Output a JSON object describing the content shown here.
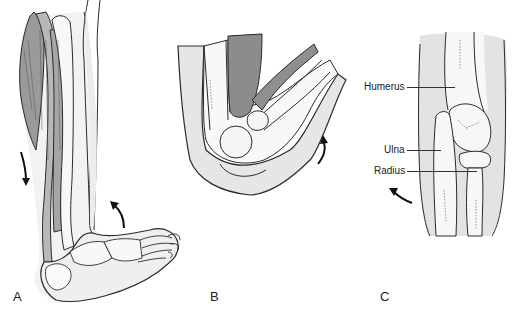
{
  "figure": {
    "panels": [
      {
        "id": "A",
        "label": "A",
        "subject": "lower leg and foot, lateral view with calf muscles",
        "arrows": [
          {
            "direction": "down",
            "meaning": "muscle pull"
          },
          {
            "direction": "up-curved",
            "meaning": "foot dorsiflexion"
          }
        ]
      },
      {
        "id": "B",
        "label": "B",
        "subject": "flexed elbow joint, lateral view",
        "arrows": [
          {
            "direction": "up-curved",
            "meaning": "forearm flexion"
          }
        ]
      },
      {
        "id": "C",
        "label": "C",
        "subject": "elbow joint, anterior view",
        "callouts": [
          {
            "text": "Humerus"
          },
          {
            "text": "Ulna"
          },
          {
            "text": "Radius"
          }
        ],
        "arrows": [
          {
            "direction": "left-curved",
            "meaning": "rotation"
          }
        ]
      }
    ],
    "colors": {
      "outline": "#2a2a2a",
      "skin_shade": "#e3e3e3",
      "bone_fill": "#f7f7f7",
      "muscle_dark": "#8f8f8f",
      "muscle_mid": "#b4b4b4",
      "background": "#ffffff"
    }
  }
}
